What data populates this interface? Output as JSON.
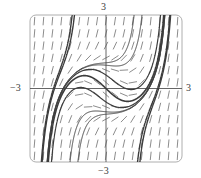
{
  "chart_data": {
    "type": "slope_field",
    "title": "",
    "equation": "dy/dx = x^2 + y^2 - 1",
    "xlim": [
      -3,
      3
    ],
    "ylim": [
      -3,
      3
    ],
    "grid": false,
    "tick_labels": {
      "x_min": "−3",
      "x_max": "3",
      "y_min": "−3",
      "y_max": "3"
    },
    "slope_grid": {
      "nx": 17,
      "ny": 12
    },
    "solution_curves": [
      {
        "x0": 0,
        "y0": 0,
        "weight": 1.6
      },
      {
        "x0": 0,
        "y0": 0.95,
        "weight": 1.0
      },
      {
        "x0": 0,
        "y0": 1.05,
        "weight": 1.0
      },
      {
        "x0": 0,
        "y0": -0.95,
        "weight": 1.0
      },
      {
        "x0": 0,
        "y0": -1.05,
        "weight": 1.0
      },
      {
        "x0": 0,
        "y0": 0.55,
        "weight": 1.2
      },
      {
        "x0": 0,
        "y0": -0.55,
        "weight": 1.2
      },
      {
        "x0": 2.2,
        "y0": 0.6,
        "weight": 1.4
      },
      {
        "x0": 2.2,
        "y0": 0.45,
        "weight": 1.4
      },
      {
        "x0": -2.2,
        "y0": -0.6,
        "weight": 1.4
      },
      {
        "x0": -2.2,
        "y0": -0.45,
        "weight": 1.4
      }
    ]
  },
  "labels": {
    "y_top": "3",
    "y_bottom": "−3",
    "x_left": "−3",
    "x_right": "3"
  },
  "colors": {
    "frame": "#9a9a9a",
    "axis": "#555555",
    "segment": "#6e6e6e",
    "curve": "#3c3c3c"
  }
}
